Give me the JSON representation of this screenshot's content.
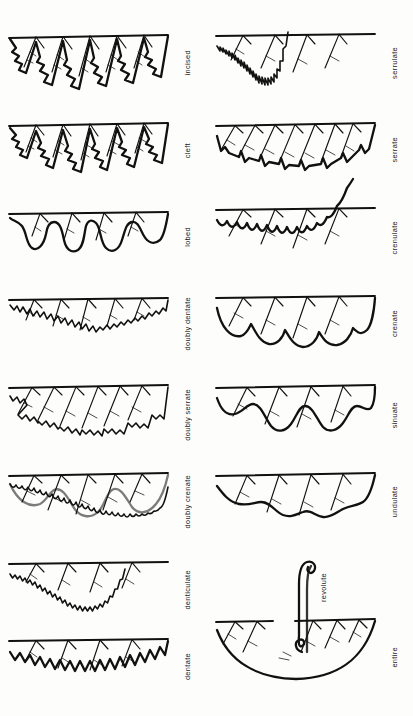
{
  "plate": {
    "title": "Leaf margin types",
    "background_color": "#fdfdfc",
    "ink_color": "#111111",
    "columns": 2
  },
  "left_column": {
    "figures": [
      {
        "label": "incised",
        "margin_type": "incised",
        "description": "Deep, sharp, irregular angular cuts toward the midrib",
        "tooth_count": 6,
        "cut_depth": "deep",
        "tooth_shape": "angular-jagged",
        "outline_style": "jagged"
      },
      {
        "label": "cleft",
        "margin_type": "cleft",
        "description": "Cut nearly halfway to the midrib into narrow lobes",
        "tooth_count": 6,
        "cut_depth": "deep",
        "tooth_shape": "angular-jagged",
        "outline_style": "jagged"
      },
      {
        "label": "lobed",
        "margin_type": "lobed",
        "description": "Deep rounded smooth indentations",
        "tooth_count": 5,
        "cut_depth": "medium",
        "tooth_shape": "rounded",
        "outline_style": "smooth-wave"
      },
      {
        "label": "doubly dentate",
        "margin_type": "doubly dentate",
        "description": "Large outward teeth bearing smaller teeth",
        "tooth_count": 6,
        "cut_depth": "shallow",
        "tooth_shape": "triangular-compound",
        "outline_style": "compound-tooth"
      },
      {
        "label": "doubly serrate",
        "margin_type": "doubly serrate",
        "description": "Large forward-pointing saw teeth bearing smaller saw teeth",
        "tooth_count": 7,
        "cut_depth": "shallow",
        "tooth_shape": "saw-compound",
        "outline_style": "compound-saw"
      },
      {
        "label": "doubly crenate",
        "margin_type": "doubly crenate",
        "description": "Large rounded scallops bearing smaller scallops",
        "tooth_count": 6,
        "cut_depth": "shallow",
        "tooth_shape": "rounded-compound",
        "outline_style": "compound-scallop"
      },
      {
        "label": "denticulate",
        "margin_type": "denticulate",
        "description": "Very small sharp teeth on an otherwise smooth curve",
        "tooth_count": 30,
        "cut_depth": "minute",
        "tooth_shape": "minute-triangular",
        "outline_style": "fine-sawtooth"
      },
      {
        "label": "dentate",
        "margin_type": "dentate",
        "description": "Teeth pointing outward, perpendicular to the margin",
        "tooth_count": 14,
        "cut_depth": "shallow",
        "tooth_shape": "triangular-outward",
        "outline_style": "sawtooth"
      }
    ]
  },
  "right_column": {
    "figures": [
      {
        "label": "serrulate",
        "margin_type": "serrulate",
        "description": "Very fine forward-pointing saw teeth",
        "tooth_count": 34,
        "cut_depth": "minute",
        "tooth_shape": "minute-saw",
        "outline_style": "fine-sawtooth-forward"
      },
      {
        "label": "serrate",
        "margin_type": "serrate",
        "description": "Sharp teeth pointing forward toward the leaf apex",
        "tooth_count": 9,
        "cut_depth": "shallow",
        "tooth_shape": "saw-forward",
        "outline_style": "sawtooth-forward"
      },
      {
        "label": "crenulate",
        "margin_type": "crenulate",
        "description": "Small rounded scallops along the margin",
        "tooth_count": 16,
        "cut_depth": "minute",
        "tooth_shape": "small-rounded",
        "outline_style": "fine-scallop"
      },
      {
        "label": "crenate",
        "margin_type": "crenate",
        "description": "Rounded, scalloped teeth",
        "tooth_count": 7,
        "cut_depth": "shallow",
        "tooth_shape": "rounded",
        "outline_style": "scallop"
      },
      {
        "label": "sinuate",
        "margin_type": "sinuate",
        "description": "Margin with deep, strong wavy indentations",
        "tooth_count": 4,
        "cut_depth": "shallow",
        "tooth_shape": "wavy",
        "outline_style": "strong-wave"
      },
      {
        "label": "undulate",
        "margin_type": "undulate",
        "description": "Margin gently wavy, waves shallower than sinuate",
        "tooth_count": 4,
        "cut_depth": "minute",
        "tooth_shape": "wavy",
        "outline_style": "gentle-wave"
      },
      {
        "label": "entire",
        "margin_type": "entire",
        "description": "Smooth, unbroken margin with no teeth or lobes",
        "tooth_count": 0,
        "cut_depth": "none",
        "tooth_shape": "none",
        "outline_style": "smooth"
      }
    ],
    "inset": {
      "label": "revolute",
      "margin_type": "revolute",
      "description": "Cross-section showing the margin rolled under toward the underside"
    }
  }
}
